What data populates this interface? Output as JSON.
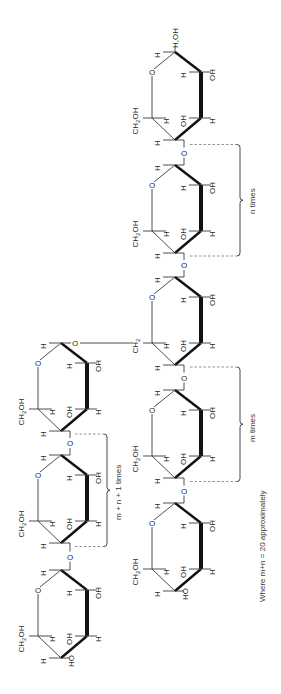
{
  "diagram": {
    "orientation": "rotated 90 degrees counter-clockwise",
    "labels": {
      "reducing_end": "H,OH",
      "ch2oh": "CH2OH",
      "ch2": "CH2",
      "oh": "OH",
      "ho": "HO",
      "h": "H",
      "o": "O"
    },
    "main_chain": {
      "rings": 5,
      "repeat_brackets": [
        {
          "label": "n times"
        },
        {
          "label": "m times"
        }
      ]
    },
    "branch_chain": {
      "rings": 3,
      "repeat_brackets": [
        {
          "label": "m + n + 1 times"
        }
      ]
    },
    "footnote": "Where m+n = 20 approximately"
  }
}
